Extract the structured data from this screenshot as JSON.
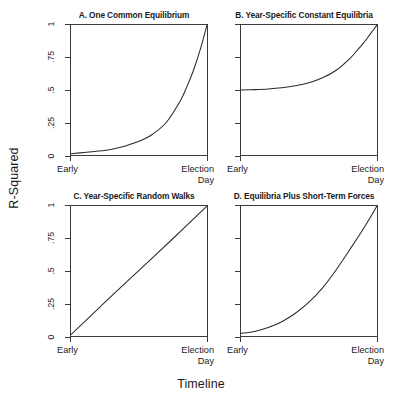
{
  "figure": {
    "ylabel": "R-Squared",
    "xlabel": "Timeline",
    "background_color": "#ffffff",
    "line_color": "#2b2b2b"
  },
  "axis": {
    "y_ticks": [
      "1",
      ".75",
      ".5",
      ".25",
      "0"
    ],
    "x_tick_left": "Early",
    "x_tick_right_line1": "Election",
    "x_tick_right_line2": "Day"
  },
  "panels": [
    {
      "id": "A",
      "title": "A. One Common Equilibrium"
    },
    {
      "id": "B",
      "title": "B. Year-Specific Constant Equilibria"
    },
    {
      "id": "C",
      "title": "C. Year-Specific Random Walks"
    },
    {
      "id": "D",
      "title": "D. Equilibria Plus Short-Term Forces"
    }
  ],
  "chart_data": [
    {
      "type": "line",
      "title": "A. One Common Equilibrium",
      "xlabel": "Timeline",
      "ylabel": "R-Squared",
      "xlim": [
        0,
        1
      ],
      "ylim": [
        0,
        1
      ],
      "xticklabels": [
        "Early",
        "Election Day"
      ],
      "yticklabels": [
        "0",
        ".25",
        ".5",
        ".75",
        "1"
      ],
      "grid": false,
      "legend": "none",
      "x": [
        0,
        0.1,
        0.2,
        0.3,
        0.4,
        0.5,
        0.6,
        0.7,
        0.8,
        0.85,
        0.9,
        0.95,
        1
      ],
      "y": [
        0.01,
        0.02,
        0.03,
        0.045,
        0.07,
        0.105,
        0.16,
        0.25,
        0.41,
        0.52,
        0.65,
        0.81,
        1.0
      ]
    },
    {
      "type": "line",
      "title": "B. Year-Specific Constant Equilibria",
      "xlabel": "Timeline",
      "ylabel": "R-Squared",
      "xlim": [
        0,
        1
      ],
      "ylim": [
        0,
        1
      ],
      "xticklabels": [
        "Early",
        "Election Day"
      ],
      "yticklabels": [
        "0",
        ".25",
        ".5",
        ".75",
        "1"
      ],
      "grid": false,
      "legend": "none",
      "x": [
        0,
        0.1,
        0.2,
        0.3,
        0.4,
        0.5,
        0.6,
        0.7,
        0.8,
        0.85,
        0.9,
        0.95,
        1
      ],
      "y": [
        0.5,
        0.503,
        0.508,
        0.517,
        0.532,
        0.556,
        0.594,
        0.652,
        0.742,
        0.8,
        0.86,
        0.93,
        1.0
      ]
    },
    {
      "type": "line",
      "title": "C. Year-Specific Random Walks",
      "xlabel": "Timeline",
      "ylabel": "R-Squared",
      "xlim": [
        0,
        1
      ],
      "ylim": [
        0,
        1
      ],
      "xticklabels": [
        "Early",
        "Election Day"
      ],
      "yticklabels": [
        "0",
        ".25",
        ".5",
        ".75",
        "1"
      ],
      "grid": false,
      "legend": "none",
      "x": [
        0,
        0.25,
        0.5,
        0.75,
        1
      ],
      "y": [
        0.01,
        0.26,
        0.505,
        0.75,
        1.0
      ]
    },
    {
      "type": "line",
      "title": "D. Equilibria Plus Short-Term Forces",
      "xlabel": "Timeline",
      "ylabel": "R-Squared",
      "xlim": [
        0,
        1
      ],
      "ylim": [
        0,
        1
      ],
      "xticklabels": [
        "Early",
        "Election Day"
      ],
      "yticklabels": [
        "0",
        ".25",
        ".5",
        ".75",
        "1"
      ],
      "grid": false,
      "legend": "none",
      "x": [
        0,
        0.1,
        0.2,
        0.3,
        0.4,
        0.5,
        0.6,
        0.7,
        0.8,
        0.9,
        1
      ],
      "y": [
        0.02,
        0.035,
        0.065,
        0.11,
        0.175,
        0.26,
        0.37,
        0.51,
        0.665,
        0.825,
        1.0
      ]
    }
  ]
}
